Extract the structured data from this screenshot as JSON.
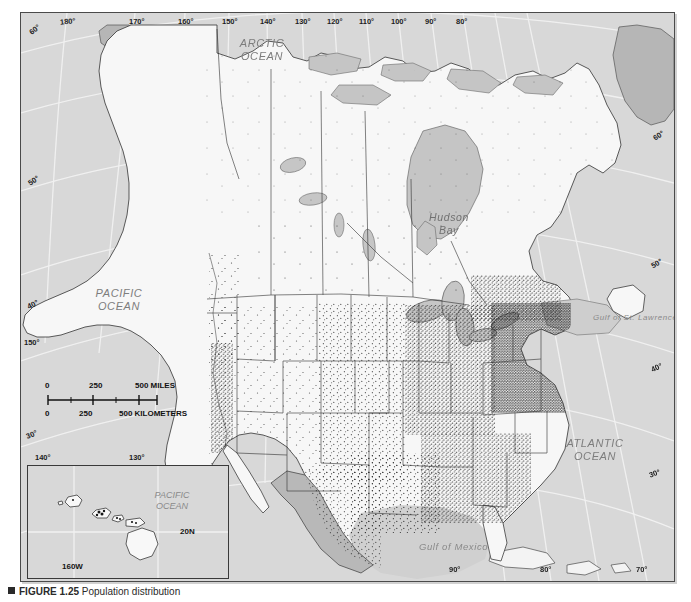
{
  "figure": {
    "marker": "■",
    "number": "FIGURE 1.25",
    "title": "Population distribution"
  },
  "map": {
    "title": "Population distribution of North America",
    "background_color": "#d8d8d8",
    "land_color": "#f7f7f7",
    "water_color": "#c9c9c9",
    "dot_color": "#1a1a1a",
    "border_color": "#4a4a4a",
    "ocean_labels": [
      {
        "name": "arctic-ocean-label",
        "text": "ARCTIC\nOCEAN",
        "x": 228,
        "y": 30
      },
      {
        "name": "pacific-ocean-label",
        "text": "PACIFIC\nOCEAN",
        "x": 78,
        "y": 280
      },
      {
        "name": "atlantic-ocean-label",
        "text": "ATLANTIC\nOCEAN",
        "x": 557,
        "y": 432
      }
    ],
    "sea_labels": [
      {
        "name": "hudson-bay-label",
        "text": "Hudson\nBay",
        "x": 425,
        "y": 205
      },
      {
        "name": "gulf-of-st-lawrence-label",
        "text": "Gulf of St. Lawrence",
        "x": 583,
        "y": 303
      },
      {
        "name": "gulf-of-mexico-label",
        "text": "Gulf of Mexico",
        "x": 415,
        "y": 548
      }
    ],
    "graticule": {
      "top_longitudes": [
        "180°",
        "170°",
        "160°",
        "150°",
        "140°",
        "130°",
        "120°",
        "110°",
        "100°",
        "90°",
        "80°"
      ],
      "bottom_longitudes": [
        "90°",
        "80°",
        "70°"
      ],
      "left_labels": [
        "60°",
        "50°",
        "40°",
        "150°",
        "30°",
        "140°"
      ],
      "right_labels": [
        "60°",
        "50°",
        "40°",
        "30°"
      ]
    },
    "graticule_positions": {
      "top": [
        {
          "label": "180°",
          "x": 39
        },
        {
          "label": "170°",
          "x": 108
        },
        {
          "label": "160°",
          "x": 157
        },
        {
          "label": "150°",
          "x": 201
        },
        {
          "label": "140°",
          "x": 239
        },
        {
          "label": "130°",
          "x": 274
        },
        {
          "label": "120°",
          "x": 306
        },
        {
          "label": "110°",
          "x": 338
        },
        {
          "label": "100°",
          "x": 370
        },
        {
          "label": "90°",
          "x": 404
        },
        {
          "label": "80°",
          "x": 435
        }
      ],
      "bottom": [
        {
          "label": "90°",
          "x": 428
        },
        {
          "label": "80°",
          "x": 519
        },
        {
          "label": "70°",
          "x": 615
        }
      ],
      "left": [
        {
          "label": "60°",
          "y": 12,
          "rot": -38
        },
        {
          "label": "50°",
          "y": 163,
          "rot": -34
        },
        {
          "label": "40°",
          "y": 287,
          "rot": -26
        },
        {
          "label": "150°",
          "y": 325,
          "rot": 0
        },
        {
          "label": "30°",
          "y": 417,
          "rot": -22
        },
        {
          "label": "140°",
          "y": 450,
          "rot": 0
        }
      ],
      "left_inner": [
        {
          "label": "130°",
          "x": 120,
          "y": 450
        }
      ],
      "right": [
        {
          "label": "60°",
          "y": 125,
          "rot": -34
        },
        {
          "label": "50°",
          "y": 252,
          "rot": -30
        },
        {
          "label": "40°",
          "y": 355,
          "rot": -25
        },
        {
          "label": "30°",
          "y": 460,
          "rot": -20
        }
      ]
    }
  },
  "scalebar": {
    "name": "distance-scale-bar",
    "miles": {
      "start": "0",
      "mid": "250",
      "end": "500 MILES"
    },
    "kilometers": {
      "start": "0",
      "mid": "250",
      "end": "500 KILOMETERS"
    }
  },
  "inset": {
    "name": "hawaii-inset-map",
    "ocean_label": "PACIFIC\nOCEAN",
    "latitude_label": "20N",
    "longitude_label": "160W"
  }
}
